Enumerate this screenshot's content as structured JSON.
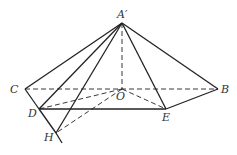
{
  "diagram": {
    "type": "geometry-pyramid",
    "points": {
      "A'": {
        "x": 122,
        "y": 23,
        "label": "A′",
        "lx": 117,
        "ly": 18
      },
      "C": {
        "x": 25,
        "y": 89,
        "label": "C",
        "lx": 10,
        "ly": 93
      },
      "B": {
        "x": 218,
        "y": 89,
        "label": "B",
        "lx": 221,
        "ly": 93
      },
      "O": {
        "x": 122,
        "y": 89,
        "label": "O",
        "lx": 116,
        "ly": 100
      },
      "D": {
        "x": 39,
        "y": 109,
        "label": "D",
        "lx": 28,
        "ly": 117
      },
      "E": {
        "x": 166,
        "y": 109,
        "label": "E",
        "lx": 162,
        "ly": 121
      },
      "H": {
        "x": 56,
        "y": 133,
        "label": "H",
        "lx": 44,
        "ly": 141
      }
    },
    "solid_segments": [
      [
        "A'",
        "C"
      ],
      [
        "A'",
        "D"
      ],
      [
        "A'",
        "H"
      ],
      [
        "A'",
        "E"
      ],
      [
        "A'",
        "B"
      ],
      [
        "C",
        "D"
      ],
      [
        "D",
        "H"
      ],
      [
        "D",
        "E"
      ],
      [
        "E",
        "B"
      ],
      [
        "H",
        "Hext"
      ]
    ],
    "dashed_segments": [
      [
        "A'",
        "O"
      ],
      [
        "C",
        "B"
      ],
      [
        "O",
        "D"
      ],
      [
        "O",
        "E"
      ],
      [
        "O",
        "H"
      ]
    ],
    "extra": {
      "Hext": {
        "x": 62,
        "y": 143
      }
    },
    "stroke_color": "#222222"
  }
}
